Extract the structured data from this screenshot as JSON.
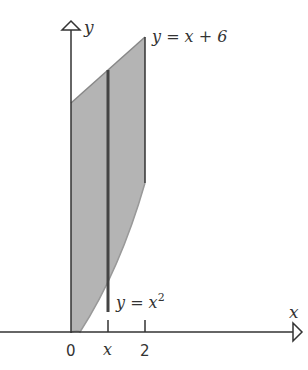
{
  "diagram": {
    "axes": {
      "x_label": "x",
      "y_label": "y"
    },
    "curves": {
      "upper": "y = x + 6",
      "lower_prefix": "y = x",
      "lower_exp": "2"
    },
    "ticks": {
      "origin": "0",
      "strip": "x",
      "end": "2"
    },
    "colors": {
      "fill": "#b4b4b4",
      "line": "#444444"
    }
  }
}
